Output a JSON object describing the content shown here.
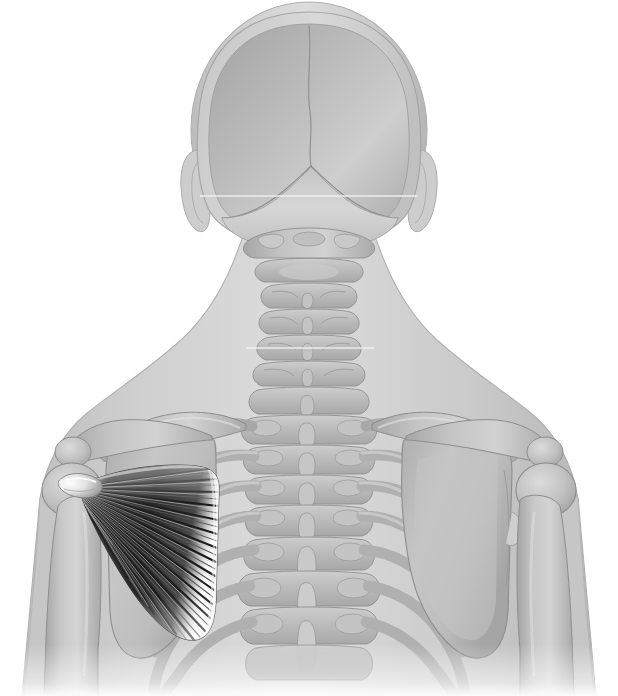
{
  "figure": {
    "title": "Posterior view of head, neck and upper torso skeleton with highlighted muscle",
    "view": "posterior",
    "canvas_width": 618,
    "canvas_height": 696,
    "background_color": "#ffffff",
    "style": "grayscale medical illustration"
  },
  "palette": {
    "background": "#ffffff",
    "body_silhouette": "#c9c9c9",
    "body_silhouette_light": "#dcdcdc",
    "body_outline": "#b4b4b4",
    "bone_fill": "#b9b9b9",
    "bone_fill_light": "#cfcfcf",
    "bone_fill_dark": "#a3a3a3",
    "bone_outline": "#8f8f8f",
    "muscle_dark": "#151515",
    "muscle_mid": "#565656",
    "muscle_light": "#e8e8e8",
    "muscle_highlight": "#ffffff",
    "artifact_line": "#f2f2f2"
  },
  "structures": {
    "skull": {
      "label": "Skull (occipital / parietal, posterior aspect)",
      "sutures": [
        {
          "name": "sagittal-suture",
          "label": "Sagittal suture"
        },
        {
          "name": "lambdoid-suture",
          "label": "Lambdoid suture"
        }
      ]
    },
    "ears": [
      {
        "name": "left-ear",
        "label": "Left auricle"
      },
      {
        "name": "right-ear",
        "label": "Right auricle"
      }
    ],
    "cervical_spine": {
      "label": "Cervical vertebrae",
      "vertebrae": [
        "C1 atlas",
        "C2 axis",
        "C3",
        "C4",
        "C5",
        "C6",
        "C7"
      ]
    },
    "thoracic_spine": {
      "label": "Thoracic vertebrae",
      "vertebrae": [
        "T1",
        "T2",
        "T3",
        "T4",
        "T5",
        "T6",
        "T7"
      ]
    },
    "shoulder_girdle": [
      {
        "name": "left-clavicle",
        "label": "Left clavicle"
      },
      {
        "name": "right-clavicle",
        "label": "Right clavicle"
      },
      {
        "name": "left-scapula",
        "label": "Left scapula"
      },
      {
        "name": "right-scapula",
        "label": "Right scapula"
      },
      {
        "name": "left-acromion",
        "label": "Left acromion"
      },
      {
        "name": "right-acromion",
        "label": "Right acromion"
      }
    ],
    "arms": [
      {
        "name": "left-humerus",
        "label": "Left humerus"
      },
      {
        "name": "right-humerus",
        "label": "Right humerus"
      }
    ],
    "ribs": {
      "label": "Ribs",
      "visible_pairs": 7
    }
  },
  "highlighted_muscle": {
    "name": "subscapularis",
    "label": "Subscapularis",
    "side": "left",
    "shape": "triangular fan",
    "origin": "Subscapular fossa of the scapula (medial border, broad base)",
    "insertion": "Lesser tubercle of the humerus (lateral apex / tendon)",
    "fiber_count": 34,
    "apex": {
      "x": 78,
      "y": 487
    },
    "base_top": {
      "x": 218,
      "y": 470
    },
    "base_bottom": {
      "x": 213,
      "y": 636
    },
    "fill_dark": "#151515",
    "fill_light": "#f0f0f0"
  },
  "annotations": {
    "render_artifact_lines": [
      {
        "name": "head-scanline",
        "y": 196
      },
      {
        "name": "neck-scanline",
        "y": 348
      }
    ]
  }
}
